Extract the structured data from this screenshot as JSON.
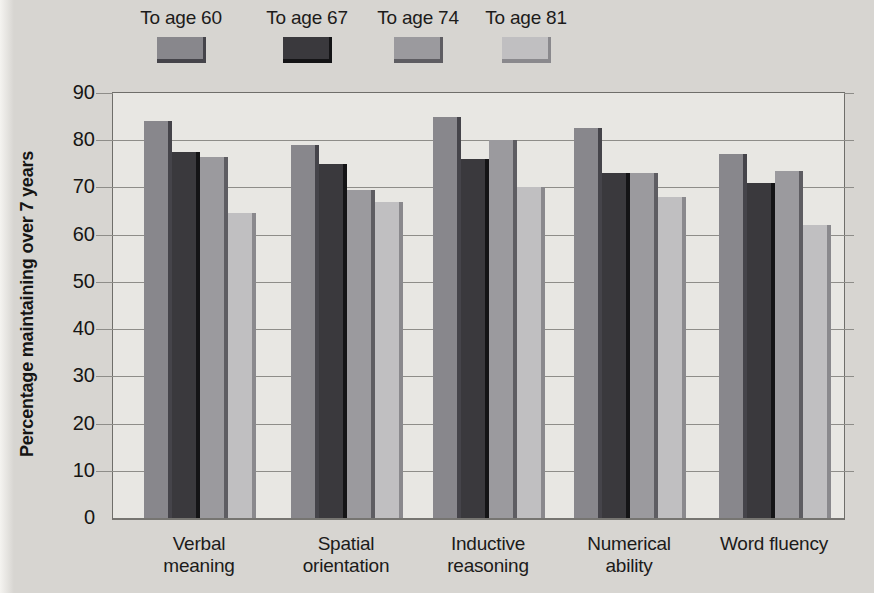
{
  "chart_data": {
    "type": "bar",
    "title": "",
    "xlabel": "",
    "ylabel": "Percentage maintaining over 7 years",
    "ylim": [
      0,
      90
    ],
    "yticks": [
      0,
      10,
      20,
      30,
      40,
      50,
      60,
      70,
      80,
      90
    ],
    "grid": true,
    "legend_position": "top",
    "categories": [
      "Verbal meaning",
      "Spatial orientation",
      "Inductive reasoning",
      "Numerical ability",
      "Word fluency"
    ],
    "series": [
      {
        "name": "To age 60",
        "color": "#88878c",
        "shadow_color": "#45444a",
        "values": [
          84,
          79,
          85,
          82.5,
          77
        ]
      },
      {
        "name": "To age 67",
        "color": "#3a393d",
        "shadow_color": "#141416",
        "values": [
          77.5,
          75,
          76,
          73,
          71
        ]
      },
      {
        "name": "To age 74",
        "color": "#9b9a9e",
        "shadow_color": "#5e5d62",
        "values": [
          76.5,
          69.5,
          80,
          73,
          73.5
        ]
      },
      {
        "name": "To age 81",
        "color": "#c0bfc1",
        "shadow_color": "#8a898d",
        "values": [
          64.5,
          67,
          70,
          68,
          62
        ]
      }
    ]
  },
  "colors": {
    "page_background": "#d7d5d1",
    "plot_background": "#e8e7e3",
    "gridline": "#8e8d89",
    "plot_border": "#6f6e6a",
    "text": "#1c1b1a"
  }
}
